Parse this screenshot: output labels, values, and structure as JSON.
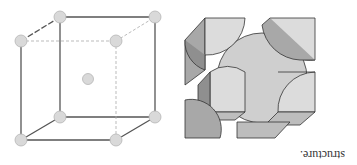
{
  "figure": {
    "orientation": "rotated 180 degrees",
    "left_panel": {
      "description": "body-centered cubic unit cell, ball-and-stick wireframe",
      "atom_color": "#d9d9d9",
      "edge_color": "#555555",
      "atoms": [
        {
          "x": 60,
          "y": 17
        },
        {
          "x": 155,
          "y": 17
        },
        {
          "x": 21,
          "y": 41
        },
        {
          "x": 116,
          "y": 41
        },
        {
          "x": 88,
          "y": 79
        },
        {
          "x": 60,
          "y": 117
        },
        {
          "x": 155,
          "y": 117
        },
        {
          "x": 21,
          "y": 140
        },
        {
          "x": 116,
          "y": 140
        }
      ]
    },
    "right_panel": {
      "description": "space-filling hard-sphere unit cell model",
      "face_light": "#dcdcdc",
      "face_mid": "#bdbdbd",
      "face_dark": "#8f8f8f"
    },
    "caption": "structure."
  }
}
